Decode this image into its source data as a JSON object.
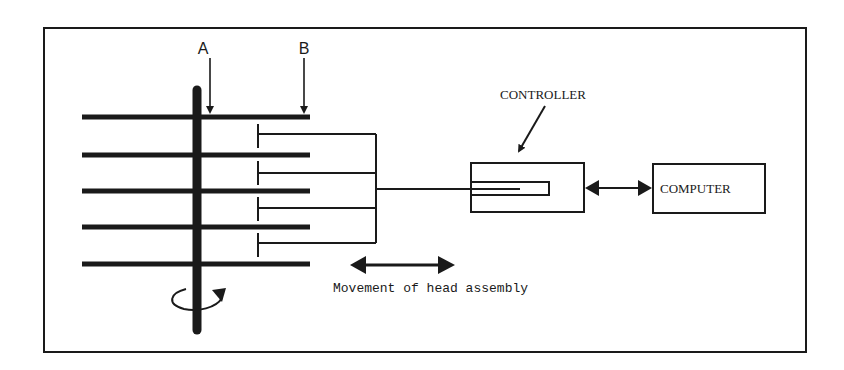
{
  "diagram": {
    "labels": {
      "a": "A",
      "b": "B",
      "controller": "CONTROLLER",
      "computer": "COMPUTER",
      "movement": "Movement of head assembly"
    },
    "colors": {
      "ink": "#1a1a1a",
      "background": "#ffffff"
    },
    "platters": {
      "count": 5
    },
    "heads": {
      "count": 4
    }
  }
}
